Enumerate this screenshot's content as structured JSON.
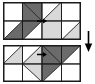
{
  "figure": {
    "colors": {
      "white": "#ffffff",
      "light_gray": "#d9d9d9",
      "dark_gray": "#6b6b6b",
      "outline": "#1a1a1a",
      "marker": "#000000",
      "background": "#ffffff"
    },
    "grid": {
      "columns": 4,
      "rows": 2,
      "cell_width": 19.5,
      "cell_height": 19
    },
    "transform_arrow": {
      "icon": "arrow-down-icon",
      "direction": "down",
      "label": ""
    },
    "panels": [
      {
        "id": "top",
        "name": "source-pattern",
        "label": "",
        "marker": {
          "icon": "arrow-right-marker-icon",
          "x": 39,
          "y": 19,
          "direction": "right"
        },
        "pieces": [
          {
            "name": "cell-r0c0-white",
            "points": "0,0 19.5,0 19.5,19 0,19",
            "fill": "white"
          },
          {
            "name": "cell-r0c1-tri-dark-a",
            "points": "19.5,0 39,0 39,19",
            "fill": "dark_gray"
          },
          {
            "name": "cell-r0c1-tri-dark-b",
            "points": "19.5,0 19.5,19 39,19",
            "fill": "dark_gray"
          },
          {
            "name": "cell-r0c2-tri-white",
            "points": "39,0 58.5,0 39,19",
            "fill": "white"
          },
          {
            "name": "cell-r0c2-tri-light",
            "points": "58.5,0 58.5,19 39,19",
            "fill": "light_gray"
          },
          {
            "name": "cell-r0c3-white",
            "points": "58.5,0 78,0 78,19 58.5,19",
            "fill": "white"
          },
          {
            "name": "cell-r1c0-tri-white",
            "points": "0,19 19.5,19 0,38",
            "fill": "white"
          },
          {
            "name": "cell-r1c0-tri-dark",
            "points": "19.5,19 19.5,38 0,38",
            "fill": "dark_gray"
          },
          {
            "name": "cell-r1c1-tri-dark",
            "points": "19.5,19 39,19 19.5,38",
            "fill": "dark_gray"
          },
          {
            "name": "cell-r1c1-tri-white",
            "points": "39,19 39,38 19.5,38",
            "fill": "white"
          },
          {
            "name": "cell-r1c2-light",
            "points": "39,19 58.5,19 58.5,38 39,38",
            "fill": "light_gray"
          },
          {
            "name": "cell-r1c3-tri-white",
            "points": "58.5,19 78,19 58.5,38",
            "fill": "white"
          },
          {
            "name": "cell-r1c3-tri-light",
            "points": "78,19 78,38 58.5,38",
            "fill": "light_gray"
          }
        ]
      },
      {
        "id": "bottom",
        "name": "result-pattern",
        "label": "",
        "marker": {
          "icon": "arrow-right-marker-icon",
          "x": 39,
          "y": 9.5,
          "direction": "right"
        },
        "pieces": [
          {
            "name": "cell-r0c0-tri-white",
            "points": "0,0 19.5,0 0,19",
            "fill": "white"
          },
          {
            "name": "cell-r0c0-tri-lightb",
            "points": "19.5,0 19.5,19 0,19",
            "fill": "light_gray"
          },
          {
            "name": "cell-r0c1-tri-white",
            "points": "19.5,0 39,0 19.5,19",
            "fill": "white"
          },
          {
            "name": "cell-r0c1-tri-light",
            "points": "39,0 39,19 19.5,19",
            "fill": "light_gray"
          },
          {
            "name": "cell-r0c2-tri-dark-a",
            "points": "39,0 58.5,0 58.5,19",
            "fill": "dark_gray"
          },
          {
            "name": "cell-r0c2-tri-dark-b",
            "points": "39,0 58.5,19 39,19",
            "fill": "dark_gray"
          },
          {
            "name": "cell-r0c3-tri-dark",
            "points": "58.5,0 78,0 58.5,19",
            "fill": "dark_gray"
          },
          {
            "name": "cell-r0c3-tri-white",
            "points": "78,0 78,19 58.5,19",
            "fill": "white"
          },
          {
            "name": "cell-r1c0-white",
            "points": "0,19 19.5,19 19.5,37 0,37",
            "fill": "white"
          },
          {
            "name": "cell-r1c1-tri-light",
            "points": "19.5,19 39,19 39,37",
            "fill": "light_gray"
          },
          {
            "name": "cell-r1c1-tri-white",
            "points": "19.5,19 39,37 19.5,37",
            "fill": "white"
          },
          {
            "name": "cell-r1c2-tri-dark",
            "points": "39,19 58.5,19 39,37",
            "fill": "dark_gray"
          },
          {
            "name": "cell-r1c2-tri-white",
            "points": "58.5,19 58.5,37 39,37",
            "fill": "white"
          },
          {
            "name": "cell-r1c3-white",
            "points": "58.5,19 78,19 78,37 58.5,37",
            "fill": "white"
          }
        ]
      }
    ]
  }
}
